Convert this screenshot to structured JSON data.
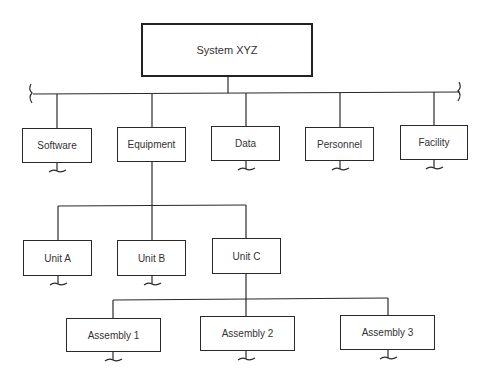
{
  "diagram": {
    "type": "hierarchy-tree",
    "root": {
      "label": "System XYZ"
    },
    "level1": [
      {
        "label": "Software"
      },
      {
        "label": "Equipment"
      },
      {
        "label": "Data"
      },
      {
        "label": "Personnel"
      },
      {
        "label": "Facility"
      }
    ],
    "level2": [
      {
        "label": "Unit A"
      },
      {
        "label": "Unit B"
      },
      {
        "label": "Unit C"
      }
    ],
    "level3": [
      {
        "label": "Assembly 1"
      },
      {
        "label": "Assembly 2"
      },
      {
        "label": "Assembly 3"
      }
    ],
    "edges": [
      [
        "System XYZ",
        "Software"
      ],
      [
        "System XYZ",
        "Equipment"
      ],
      [
        "System XYZ",
        "Data"
      ],
      [
        "System XYZ",
        "Personnel"
      ],
      [
        "System XYZ",
        "Facility"
      ],
      [
        "Equipment",
        "Unit A"
      ],
      [
        "Equipment",
        "Unit B"
      ],
      [
        "Equipment",
        "Unit C"
      ],
      [
        "Unit C",
        "Assembly 1"
      ],
      [
        "Unit C",
        "Assembly 2"
      ],
      [
        "Unit C",
        "Assembly 3"
      ]
    ],
    "line_color": "#2a2a2a"
  }
}
